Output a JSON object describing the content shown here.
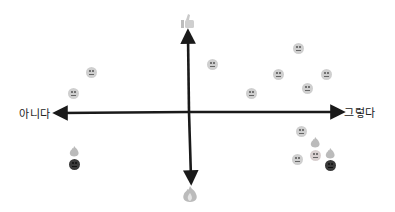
{
  "axes": {
    "negative_label": "아니다",
    "positive_label": "그렇다",
    "top_icon": "thumbs-up-icon",
    "bottom_icon": "fire-icon",
    "axis_color": "#1a1a1a"
  },
  "points": [
    {
      "icon": "slight-smile-face-icon",
      "x": 91,
      "y": 72
    },
    {
      "icon": "neutral-face-icon",
      "x": 73,
      "y": 93
    },
    {
      "icon": "frown-face-icon",
      "x": 213,
      "y": 65
    },
    {
      "icon": "neutral-face-icon",
      "x": 298,
      "y": 48
    },
    {
      "icon": "neutral-face-icon",
      "x": 278,
      "y": 74
    },
    {
      "icon": "slight-smile-face-icon",
      "x": 326,
      "y": 74
    },
    {
      "icon": "slight-smile-face-icon",
      "x": 251,
      "y": 93
    },
    {
      "icon": "neutral-face-icon",
      "x": 307,
      "y": 88
    },
    {
      "icon": "frown-face-icon",
      "x": 301,
      "y": 131
    },
    {
      "icon": "angry-face-icon",
      "x": 297,
      "y": 159
    },
    {
      "icon": "fire-face-icon",
      "x": 315,
      "y": 150
    },
    {
      "icon": "dark-face-with-fire-icon",
      "x": 330,
      "y": 160
    },
    {
      "icon": "dark-face-with-fire-icon",
      "x": 74,
      "y": 160
    }
  ]
}
